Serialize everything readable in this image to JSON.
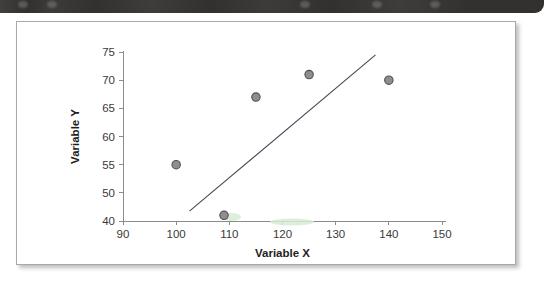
{
  "banner": {
    "name": "top-banner-strip",
    "color": "#33312f",
    "smudges": [
      {
        "left": 18
      },
      {
        "left": 47
      },
      {
        "left": 300
      },
      {
        "left": 372
      },
      {
        "left": 430
      }
    ]
  },
  "panel": {
    "border_color": "#a8a8a8",
    "background": "#ffffff"
  },
  "chart_data": {
    "type": "scatter",
    "title": "",
    "xlabel": "Variable X",
    "ylabel": "Variable Y",
    "xlim": [
      90,
      150
    ],
    "ylim": [
      40,
      75
    ],
    "xticks": [
      90,
      100,
      110,
      120,
      130,
      140,
      150
    ],
    "xtick_labels": [
      "90",
      "100",
      "110",
      "120",
      "130",
      "140",
      "150"
    ],
    "yticks": [
      40,
      50,
      55,
      60,
      65,
      70,
      75
    ],
    "ytick_labels": [
      "40",
      "50",
      "55",
      "60",
      "65",
      "70",
      "75"
    ],
    "grid": false,
    "legend": false,
    "marker_color": "#8e8e8e",
    "marker_edge_color": "#4f4f4f",
    "points": [
      {
        "x": 100,
        "y": 55
      },
      {
        "x": 109,
        "y": 42
      },
      {
        "x": 115,
        "y": 67
      },
      {
        "x": 125,
        "y": 71
      },
      {
        "x": 140,
        "y": 70
      }
    ],
    "trendline": {
      "color": "#4a4656",
      "x_start": 102.5,
      "y_start": 43.5,
      "x_end": 137.5,
      "y_end": 74.5
    }
  }
}
